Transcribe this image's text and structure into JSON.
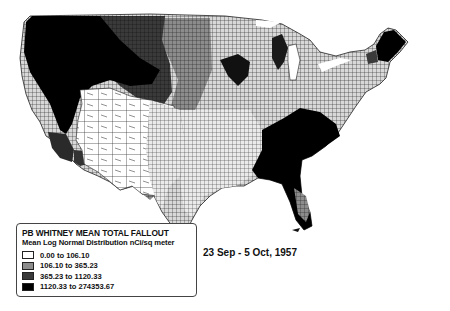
{
  "map": {
    "title": "PB WHITNEY MEAN TOTAL FALLOUT",
    "subtitle": "Mean Log Normal Distribution nCi/sq meter",
    "date_range": "23 Sep - 5 Oct, 1957",
    "region": "Contiguous United States (county level)",
    "legend": {
      "items": [
        {
          "label": "0.00 to 106.10",
          "color": "#ffffff"
        },
        {
          "label": "106.10 to 365.23",
          "color": "#8c8c8c"
        },
        {
          "label": "365.23 to 1120.33",
          "color": "#3a3a3a"
        },
        {
          "label": "1120.33 to 274353.67",
          "color": "#000000"
        }
      ]
    },
    "colors": {
      "class1": "#ffffff",
      "class2": "#8c8c8c",
      "class3": "#3a3a3a",
      "class4": "#000000",
      "county_border": "#2a2a2a"
    }
  }
}
